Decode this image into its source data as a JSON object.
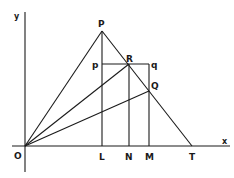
{
  "diagram": {
    "type": "geometry",
    "axes": {
      "x_label": "x",
      "y_label": "y",
      "origin_label": "O"
    },
    "points": {
      "O": {
        "label": "O",
        "x": 25,
        "y": 146
      },
      "P": {
        "label": "P",
        "x": 102,
        "y": 31
      },
      "p": {
        "label": "p",
        "x": 102,
        "y": 64
      },
      "R": {
        "label": "R",
        "x": 129,
        "y": 64
      },
      "q": {
        "label": "q",
        "x": 149,
        "y": 64
      },
      "Q": {
        "label": "Q",
        "x": 149,
        "y": 91
      },
      "L": {
        "label": "L",
        "x": 102,
        "y": 146
      },
      "N": {
        "label": "N",
        "x": 129,
        "y": 146
      },
      "M": {
        "label": "M",
        "x": 149,
        "y": 146
      },
      "T": {
        "label": "T",
        "x": 192,
        "y": 146
      }
    },
    "segments": [
      [
        "O",
        "P"
      ],
      [
        "P",
        "T"
      ],
      [
        "O",
        "R"
      ],
      [
        "O",
        "Q"
      ],
      [
        "P",
        "L"
      ],
      [
        "R",
        "N"
      ],
      [
        "q",
        "M"
      ],
      [
        "p",
        "q"
      ]
    ],
    "line_color": "#1a1a1a",
    "background": "#ffffff"
  }
}
